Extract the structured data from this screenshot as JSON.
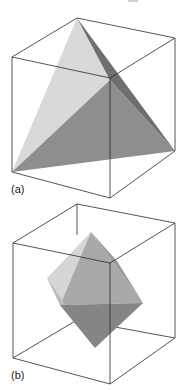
{
  "figures": [
    {
      "label": "(a)",
      "solid": "tetrahedron",
      "cube_vertices": {
        "top_back": [
          77,
          18
        ],
        "top_left": [
          12,
          57
        ],
        "top_right": [
          175,
          38
        ],
        "top_front": [
          110,
          78
        ],
        "bottom_left": [
          12,
          172
        ],
        "bottom_right": [
          175,
          151
        ],
        "bottom_front": [
          110,
          198
        ]
      },
      "faces": [
        {
          "name": "light-face",
          "color": "#d9d9d9",
          "points": "77,18 12,172 110,80"
        },
        {
          "name": "dark-face",
          "color": "#8e8e8e",
          "points": "12,172 110,80 175,151"
        },
        {
          "name": "shadow-face",
          "color": "#6f6f6f",
          "points": "77,18 110,80 175,151"
        }
      ]
    },
    {
      "label": "(b)",
      "solid": "octahedron",
      "cube_vertices": {
        "top_back": [
          77,
          9
        ],
        "top_left": [
          13,
          48
        ],
        "top_right": [
          175,
          28
        ],
        "top_front": [
          110,
          68
        ],
        "bottom_left": [
          13,
          163
        ],
        "bottom_right": [
          175,
          143
        ],
        "bottom_front": [
          110,
          189
        ],
        "bottom_back": [
          77,
          125
        ]
      },
      "faces": [
        {
          "name": "light-left-face",
          "color": "#d6d6d6",
          "points": "91,37 47,83 60,110"
        },
        {
          "name": "upper-front-face",
          "color": "#a9a9a9",
          "points": "91,37 60,110 143,108"
        },
        {
          "name": "upper-right-face",
          "color": "#9a9a9a",
          "points": "91,37 143,108 117,66"
        },
        {
          "name": "lower-left-face",
          "color": "#bdbdbd",
          "points": "47,83 60,110 95,153"
        },
        {
          "name": "lower-front-face",
          "color": "#858585",
          "points": "60,110 143,108 95,153"
        }
      ]
    }
  ],
  "colors": {
    "edge": "#2a2a2a",
    "background": "#ffffff"
  }
}
